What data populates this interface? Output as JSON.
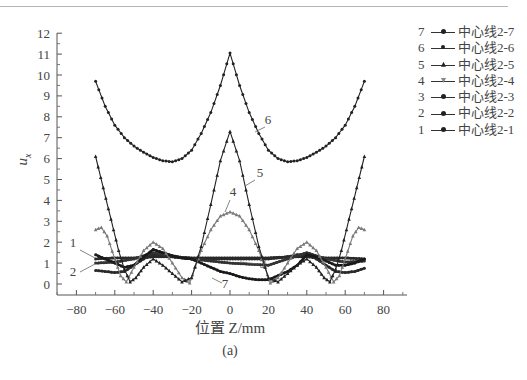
{
  "chart_data": {
    "type": "line",
    "title": "",
    "caption": "(a)",
    "xlabel": "位置 Z/mm",
    "ylabel": "u_x",
    "ylabel_main": "u",
    "ylabel_sub": "x",
    "xlim": [
      -92,
      92
    ],
    "ylim": [
      0,
      12
    ],
    "xticks": [
      -80,
      -60,
      -40,
      -20,
      0,
      20,
      40,
      60,
      80
    ],
    "yticks": [
      0,
      1,
      2,
      3,
      4,
      5,
      6,
      7,
      8,
      9,
      10,
      11,
      12
    ],
    "grid": false,
    "legend_position": "right",
    "series": [
      {
        "id": "1",
        "name": "中心线2-1",
        "color": "#2a2a2a",
        "marker": "circle",
        "x": [
          -70,
          -60,
          -50,
          -40,
          -30,
          -20,
          -10,
          0,
          10,
          20,
          30,
          40,
          50,
          60,
          70
        ],
        "y": [
          1.2,
          1.25,
          1.25,
          1.3,
          1.3,
          1.25,
          1.25,
          1.25,
          1.25,
          1.25,
          1.3,
          1.3,
          1.25,
          1.25,
          1.2
        ]
      },
      {
        "id": "2",
        "name": "中心线2-2",
        "color": "#2a2a2a",
        "marker": "circle",
        "x": [
          -70,
          -65,
          -60,
          -55,
          -50,
          -45,
          -40,
          -35,
          -30,
          -20,
          -10,
          0,
          10,
          20,
          30,
          35,
          40,
          45,
          50,
          55,
          60,
          65,
          70
        ],
        "y": [
          0.65,
          0.6,
          0.55,
          0.6,
          0.9,
          1.2,
          1.4,
          1.4,
          1.3,
          1.2,
          1.2,
          1.2,
          1.2,
          1.2,
          1.3,
          1.4,
          1.4,
          1.2,
          0.9,
          0.6,
          0.55,
          0.6,
          0.75
        ]
      },
      {
        "id": "3",
        "name": "中心线2-3",
        "color": "#333333",
        "marker": "circle",
        "x": [
          -70,
          -60,
          -50,
          -40,
          -30,
          -20,
          -10,
          0,
          10,
          20,
          30,
          40,
          50,
          60,
          70
        ],
        "y": [
          1.0,
          1.05,
          1.2,
          1.5,
          1.35,
          1.2,
          1.1,
          1.0,
          0.95,
          0.9,
          1.2,
          1.5,
          1.2,
          1.05,
          1.1
        ]
      },
      {
        "id": "4",
        "name": "中心线2-4",
        "color": "#7a7a7a",
        "marker": "triangle",
        "x": [
          -70,
          -67,
          -64,
          -60,
          -57,
          -54,
          -50,
          -45,
          -40,
          -35,
          -30,
          -25,
          -21,
          -15,
          -10,
          -5,
          0,
          5,
          10,
          15,
          21,
          25,
          30,
          35,
          40,
          45,
          50,
          54,
          57,
          60,
          64,
          67,
          70
        ],
        "y": [
          2.6,
          2.7,
          2.3,
          1.2,
          0.4,
          0.1,
          0.8,
          1.6,
          2.0,
          1.7,
          1.0,
          0.3,
          0.05,
          1.6,
          2.6,
          3.25,
          3.45,
          3.25,
          2.6,
          1.6,
          0.05,
          0.3,
          1.0,
          1.7,
          2.0,
          1.6,
          0.8,
          0.1,
          0.4,
          1.2,
          2.3,
          2.7,
          2.6
        ]
      },
      {
        "id": "5",
        "name": "中心线2-5",
        "color": "#222222",
        "marker": "triangle",
        "x": [
          -70,
          -66,
          -62,
          -58,
          -55,
          -52,
          -49,
          -45,
          -40,
          -35,
          -30,
          -25,
          -20,
          -15,
          -10,
          -5,
          0,
          5,
          10,
          15,
          20,
          25,
          30,
          35,
          40,
          45,
          49,
          52,
          55,
          58,
          62,
          66,
          70
        ],
        "y": [
          6.1,
          4.6,
          3.1,
          1.6,
          0.7,
          0.1,
          0.3,
          0.8,
          1.2,
          0.9,
          0.5,
          0.1,
          0.3,
          1.8,
          3.8,
          5.9,
          7.3,
          5.9,
          3.8,
          1.8,
          0.3,
          0.1,
          0.5,
          0.9,
          1.2,
          0.8,
          0.3,
          0.1,
          0.7,
          1.6,
          3.1,
          4.6,
          6.1
        ]
      },
      {
        "id": "6",
        "name": "中心线2-6",
        "color": "#222222",
        "marker": "circle",
        "x": [
          -70,
          -65,
          -60,
          -55,
          -50,
          -45,
          -40,
          -35,
          -30,
          -25,
          -20,
          -15,
          -10,
          -5,
          0,
          5,
          10,
          15,
          20,
          25,
          30,
          35,
          40,
          45,
          50,
          55,
          60,
          65,
          70
        ],
        "y": [
          9.7,
          8.5,
          7.6,
          7.0,
          6.6,
          6.3,
          6.05,
          5.9,
          5.85,
          6.0,
          6.4,
          7.2,
          8.2,
          9.5,
          11.05,
          9.5,
          8.2,
          7.2,
          6.4,
          6.0,
          5.85,
          5.9,
          6.05,
          6.3,
          6.6,
          7.0,
          7.6,
          8.5,
          9.7
        ]
      },
      {
        "id": "7",
        "name": "中心线2-7",
        "color": "#1a1a1a",
        "marker": "circle",
        "x": [
          -70,
          -65,
          -60,
          -55,
          -50,
          -45,
          -40,
          -35,
          -30,
          -25,
          -20,
          -15,
          -10,
          -5,
          0,
          5,
          10,
          15,
          20,
          25,
          30,
          35,
          40,
          45,
          50,
          55,
          60,
          65,
          70
        ],
        "y": [
          1.4,
          1.2,
          1.0,
          0.8,
          0.9,
          1.3,
          1.65,
          1.5,
          1.35,
          1.25,
          1.2,
          1.0,
          0.8,
          0.6,
          0.5,
          0.35,
          0.25,
          0.2,
          0.2,
          0.4,
          0.6,
          0.9,
          1.4,
          1.3,
          1.1,
          0.9,
          0.9,
          1.0,
          1.2
        ]
      }
    ],
    "annotations": [
      {
        "label": "1",
        "x_px": 73,
        "y_px": 247
      },
      {
        "label": "2",
        "x_px": 73,
        "y_px": 276
      },
      {
        "label": "3",
        "x_px": 263,
        "y_px": 268
      },
      {
        "label": "4",
        "x_px": 233,
        "y_px": 196
      },
      {
        "label": "5",
        "x_px": 260,
        "y_px": 177
      },
      {
        "label": "6",
        "x_px": 268,
        "y_px": 124
      },
      {
        "label": "7",
        "x_px": 225,
        "y_px": 288
      }
    ]
  },
  "legend": {
    "items": [
      {
        "num": "7",
        "label": "中心线2-7"
      },
      {
        "num": "6",
        "label": "中心线2-6"
      },
      {
        "num": "5",
        "label": "中心线2-5"
      },
      {
        "num": "4",
        "label": "中心线2-4"
      },
      {
        "num": "3",
        "label": "中心线2-3"
      },
      {
        "num": "2",
        "label": "中心线2-2"
      },
      {
        "num": "1",
        "label": "中心线2-1"
      }
    ]
  },
  "axes": {
    "xlabel": "位置 Z/mm",
    "caption": "(a)"
  }
}
